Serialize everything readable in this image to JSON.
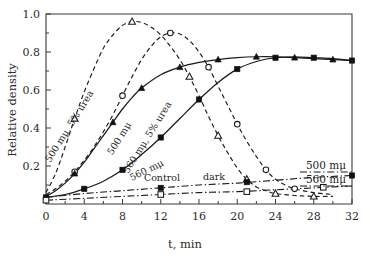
{
  "figure": {
    "background": "#ffffff",
    "ink": "#1a1a1a"
  },
  "axes": {
    "x": {
      "title": "t, min",
      "min": 0,
      "max": 32,
      "ticks": [
        0,
        4,
        8,
        12,
        16,
        20,
        24,
        28,
        32
      ],
      "ticklabels": [
        "0",
        "4",
        "8",
        "12",
        "16",
        "20",
        "24",
        "28",
        "32"
      ],
      "minor_step": 2
    },
    "y": {
      "title": "Relative density",
      "min": 0.0,
      "max": 1.0,
      "ticks": [
        0.2,
        0.4,
        0.6,
        0.8,
        1.0
      ],
      "ticklabels": [
        "0.2",
        "0.4",
        "0.6",
        "0.8",
        "1.0"
      ],
      "minor_step": 0.1
    },
    "grid": false,
    "frame": "box"
  },
  "inline_labels": [
    {
      "name": "label-500-urea",
      "text": "500 mμ, 5% urea",
      "x": 72,
      "y": 128,
      "rotate": -58
    },
    {
      "name": "label-500",
      "text": "500 mμ",
      "x": 122,
      "y": 140,
      "rotate": -58
    },
    {
      "name": "label-560-urea",
      "text": "560 mμ, 5% urea",
      "x": 150,
      "y": 139,
      "rotate": -58
    },
    {
      "name": "label-560",
      "text": "560 mμ",
      "x": 148,
      "y": 173,
      "rotate": -26
    },
    {
      "name": "label-control",
      "text": "Control",
      "x": 162,
      "y": 181,
      "rotate": 0
    },
    {
      "name": "label-dark",
      "text": "dark",
      "x": 214,
      "y": 180,
      "rotate": 0
    }
  ],
  "legend": {
    "position": "right-inside",
    "entries": [
      {
        "name": "legend-500",
        "label": "500 mμ",
        "style": "dash-dot"
      },
      {
        "name": "legend-560",
        "label": "560 mμ",
        "style": "dash-dot"
      }
    ]
  },
  "chart_data": {
    "type": "line",
    "title": "",
    "xlabel": "t, min",
    "ylabel": "Relative density",
    "xlim": [
      0,
      32
    ],
    "ylim": [
      0,
      1.0
    ],
    "grid": false,
    "series": [
      {
        "name": "500 mμ, 5% urea",
        "style": "dashed",
        "marker": "open-triangle",
        "comment": "light-induced transient, peaks early then decays to baseline",
        "x": [
          0,
          1,
          2,
          3,
          4,
          5,
          6,
          7,
          8,
          9,
          10,
          11,
          12,
          13,
          14,
          15,
          16,
          17,
          18,
          19,
          20,
          21,
          22,
          23,
          24,
          26,
          28,
          30
        ],
        "y": [
          0.06,
          0.16,
          0.3,
          0.45,
          0.59,
          0.71,
          0.82,
          0.89,
          0.94,
          0.96,
          0.955,
          0.93,
          0.89,
          0.83,
          0.76,
          0.67,
          0.57,
          0.46,
          0.36,
          0.27,
          0.19,
          0.13,
          0.09,
          0.07,
          0.055,
          0.045,
          0.04,
          0.04
        ],
        "marker_x": [
          3,
          9,
          15,
          18,
          21,
          24,
          28
        ],
        "marker_y": [
          0.45,
          0.96,
          0.67,
          0.36,
          0.13,
          0.055,
          0.04
        ]
      },
      {
        "name": "500 mμ",
        "style": "dashed",
        "marker": "open-circle",
        "comment": "light-induced transient, peaks later, decays to baseline",
        "x": [
          0,
          1,
          2,
          3,
          4,
          5,
          6,
          7,
          8,
          9,
          10,
          11,
          12,
          13,
          14,
          15,
          16,
          17,
          18,
          19,
          20,
          21,
          22,
          23,
          24,
          25,
          26,
          28,
          30
        ],
        "y": [
          0.05,
          0.08,
          0.12,
          0.17,
          0.23,
          0.3,
          0.38,
          0.47,
          0.57,
          0.67,
          0.76,
          0.83,
          0.88,
          0.9,
          0.895,
          0.86,
          0.8,
          0.72,
          0.62,
          0.52,
          0.42,
          0.33,
          0.25,
          0.18,
          0.13,
          0.1,
          0.08,
          0.06,
          0.05
        ],
        "marker_x": [
          3,
          8,
          13,
          17,
          20,
          23,
          26
        ],
        "marker_y": [
          0.17,
          0.57,
          0.9,
          0.72,
          0.42,
          0.18,
          0.08
        ]
      },
      {
        "name": "560 mμ, 5% urea",
        "style": "solid",
        "marker": "filled-triangle",
        "comment": "sigmoid rise to plateau ~0.77",
        "x": [
          0,
          1,
          2,
          3,
          4,
          5,
          6,
          7,
          8,
          9,
          10,
          12,
          14,
          16,
          18,
          20,
          22,
          24,
          26,
          28,
          30,
          32
        ],
        "y": [
          0.04,
          0.07,
          0.11,
          0.16,
          0.22,
          0.29,
          0.36,
          0.43,
          0.5,
          0.56,
          0.61,
          0.68,
          0.72,
          0.745,
          0.76,
          0.77,
          0.775,
          0.775,
          0.77,
          0.765,
          0.76,
          0.755
        ],
        "marker_x": [
          3,
          7,
          10,
          14,
          18,
          22,
          26,
          30
        ],
        "marker_y": [
          0.16,
          0.43,
          0.61,
          0.72,
          0.76,
          0.775,
          0.77,
          0.76
        ]
      },
      {
        "name": "560 mμ",
        "style": "solid",
        "marker": "filled-square",
        "comment": "slower sigmoid rise to same plateau ~0.77",
        "x": [
          0,
          2,
          4,
          6,
          8,
          10,
          12,
          14,
          16,
          18,
          20,
          22,
          24,
          26,
          28,
          30,
          32
        ],
        "y": [
          0.035,
          0.05,
          0.08,
          0.12,
          0.18,
          0.26,
          0.35,
          0.45,
          0.55,
          0.64,
          0.71,
          0.75,
          0.77,
          0.775,
          0.77,
          0.765,
          0.755
        ],
        "marker_x": [
          4,
          8,
          12,
          16,
          20,
          24,
          28,
          32
        ],
        "marker_y": [
          0.08,
          0.18,
          0.35,
          0.55,
          0.71,
          0.77,
          0.77,
          0.755
        ]
      },
      {
        "name": "Control 500 mμ",
        "style": "dash-dot",
        "marker": "filled-square",
        "comment": "control / dark baseline, slight linear rise",
        "x": [
          0,
          4,
          8,
          12,
          16,
          20,
          24,
          28,
          32
        ],
        "y": [
          0.035,
          0.055,
          0.07,
          0.085,
          0.1,
          0.11,
          0.125,
          0.14,
          0.15
        ],
        "marker_x": [
          0,
          12,
          21,
          32
        ],
        "marker_y": [
          0.035,
          0.085,
          0.115,
          0.15
        ]
      },
      {
        "name": "Control 560 mμ",
        "style": "dash-dot",
        "marker": "open-square",
        "comment": "lower control baseline, nearly flat",
        "x": [
          0,
          4,
          8,
          12,
          16,
          20,
          24,
          28,
          32
        ],
        "y": [
          0.02,
          0.03,
          0.04,
          0.05,
          0.06,
          0.065,
          0.075,
          0.085,
          0.095
        ],
        "marker_x": [
          0,
          12,
          21,
          29
        ],
        "marker_y": [
          0.02,
          0.05,
          0.065,
          0.088
        ]
      }
    ]
  }
}
